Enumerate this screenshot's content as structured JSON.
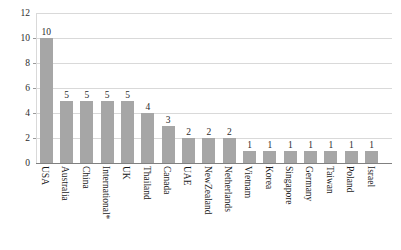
{
  "chart_data": {
    "type": "bar",
    "title": "",
    "subtitle": "",
    "xlabel": "",
    "ylabel": "",
    "ylim": [
      0,
      12
    ],
    "yticks": [
      0,
      2,
      4,
      6,
      8,
      10,
      12
    ],
    "grid": true,
    "legend": false,
    "legend_position": "none",
    "bar_color": "#a6a6a6",
    "gridline_color": "#d9d9d9",
    "axis_color": "#808080",
    "data_labels_shown": true,
    "categories": [
      "USA",
      "Australia",
      "China",
      "International*",
      "UK",
      "Thailand",
      "Canada",
      "UAE",
      "NewZealand",
      "Netherlands",
      "Vietnam",
      "Korea",
      "Singapore",
      "Germany",
      "Taiwan",
      "Poland",
      "Israel"
    ],
    "values": [
      10,
      5,
      5,
      5,
      5,
      4,
      3,
      2,
      2,
      2,
      1,
      1,
      1,
      1,
      1,
      1,
      1
    ],
    "labels": [
      "10",
      "5",
      "5",
      "5",
      "5",
      "4",
      "3",
      "2",
      "2",
      "2",
      "1",
      "1",
      "1",
      "1",
      "1",
      "1",
      "1"
    ],
    "ytick_labels": [
      "0",
      "2",
      "4",
      "6",
      "8",
      "10",
      "12"
    ]
  }
}
